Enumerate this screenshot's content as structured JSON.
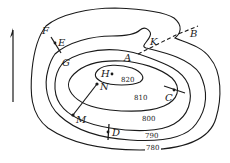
{
  "diagram": {
    "type": "topographic-contour-map",
    "north_arrow": {
      "direction": "up"
    },
    "contours": [
      {
        "elevation": "780",
        "label": "780"
      },
      {
        "elevation": "790",
        "label": "790"
      },
      {
        "elevation": "800",
        "label": "800"
      },
      {
        "elevation": "810",
        "label": "810"
      },
      {
        "elevation": "820",
        "label": "820"
      }
    ],
    "points": {
      "A": "A",
      "B": "B",
      "C": "C",
      "D": "D",
      "E": "E",
      "F": "F",
      "G": "G",
      "H": "H",
      "K": "K",
      "M": "M",
      "N": "N"
    },
    "segments": [
      {
        "from": "F",
        "to": "E",
        "style": "solid"
      },
      {
        "from": "M",
        "to": "N",
        "style": "solid"
      },
      {
        "from": "C",
        "to": "C-end",
        "style": "solid"
      },
      {
        "from": "D",
        "to": "D-end",
        "style": "solid"
      },
      {
        "from": "A",
        "to": "B",
        "style": "dashed",
        "via": "K"
      }
    ]
  }
}
